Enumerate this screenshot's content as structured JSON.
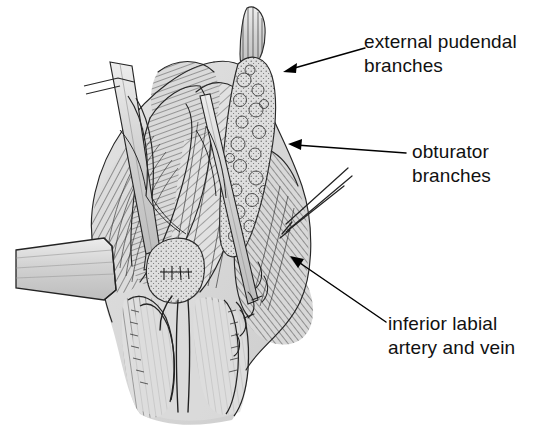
{
  "figure": {
    "kind": "anatomical-line-drawing",
    "style": "pen-and-ink engraving with hatching",
    "background_color": "#ffffff",
    "ink_color": "#1a1a1a",
    "tissue_fill": "#d9d9d9"
  },
  "labels": [
    {
      "id": "external-pudendal",
      "line1": "external pudendal",
      "line2": "branches",
      "arrow_from": [
        365,
        48
      ],
      "arrow_to": [
        283,
        72
      ]
    },
    {
      "id": "obturator",
      "line1": "obturator",
      "line2": "branches",
      "arrow_from": [
        406,
        153
      ],
      "arrow_to": [
        288,
        144
      ]
    },
    {
      "id": "inferior-labial",
      "line1": "inferior labial",
      "line2": "artery and vein",
      "arrow_from": [
        386,
        322
      ],
      "arrow_to": [
        290,
        256
      ]
    }
  ],
  "structures": [
    {
      "name": "external-pudendal-vessel-stalk",
      "description": "nodular vascular stalk ascending at top center-right"
    },
    {
      "name": "obturator-branch-fat-pad",
      "description": "lobulated fatty vascular mass mid-right"
    },
    {
      "name": "inferior-labial-vessels",
      "description": "hatched tissue plane lower right"
    },
    {
      "name": "retractor-blade",
      "description": "flat surgical retractor entering from the left margin"
    },
    {
      "name": "forceps-instrument",
      "description": "forceps entering from upper right"
    },
    {
      "name": "dissecting-probe",
      "description": "slender probe crossing upper left field"
    },
    {
      "name": "urethral-meatus",
      "description": "central stippled ovoid structure"
    },
    {
      "name": "labial-folds",
      "description": "paired folds at inferior aspect with central cleft"
    }
  ]
}
